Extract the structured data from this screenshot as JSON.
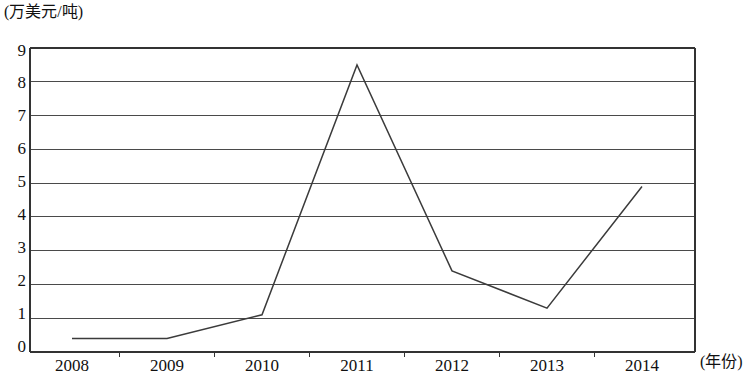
{
  "chart_data": {
    "type": "line",
    "title": "",
    "subtitle": "",
    "xlabel": "(年份)",
    "ylabel": "(万美元/吨)",
    "x": [
      "2008",
      "2009",
      "2010",
      "2011",
      "2012",
      "2013",
      "2014"
    ],
    "categories": [
      "2008",
      "2009",
      "2010",
      "2011",
      "2012",
      "2013",
      "2014"
    ],
    "values": [
      0.4,
      0.4,
      1.1,
      8.5,
      2.4,
      1.3,
      4.9
    ],
    "series": [
      {
        "name": "价格",
        "values": [
          0.4,
          0.4,
          1.1,
          8.5,
          2.4,
          1.3,
          4.9
        ]
      }
    ],
    "ylim": [
      0,
      9
    ],
    "yticks": [
      0,
      1,
      2,
      3,
      4,
      5,
      6,
      7,
      8,
      9
    ],
    "ytick_labels": [
      "0",
      "1",
      "2",
      "3",
      "4",
      "5",
      "6",
      "7",
      "8",
      "9"
    ],
    "xtick_labels": [
      "2008",
      "2009",
      "2010",
      "2011",
      "2012",
      "2013",
      "2014"
    ],
    "grid": true,
    "grid_axis": "y",
    "legend": false,
    "legend_position": "none",
    "line_color": "#3b3b3b",
    "grid_color": "#4a4a4a",
    "axis_color": "#333333",
    "background": "#ffffff",
    "markers": false,
    "annotations": []
  },
  "axes": {
    "y_unit_label": "(万美元/吨)",
    "x_unit_label": "(年份)"
  }
}
